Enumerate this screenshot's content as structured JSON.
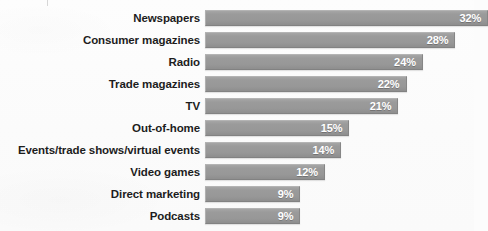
{
  "chart_data": {
    "type": "bar",
    "orientation": "horizontal",
    "title": "",
    "subtitle": "",
    "xlabel": "",
    "ylabel": "",
    "grid": false,
    "legend": null,
    "value_suffix": "%",
    "xlim": [
      0,
      32
    ],
    "categories": [
      "Newspapers",
      "Consumer magazines",
      "Radio",
      "Trade magazines",
      "TV",
      "Out-of-home",
      "Events/trade shows/virtual events",
      "Video games",
      "Direct marketing",
      "Podcasts"
    ],
    "values": [
      32,
      28,
      24,
      22,
      21,
      15,
      14,
      12,
      9,
      9
    ],
    "value_labels": [
      "32%",
      "28%",
      "24%",
      "22%",
      "21%",
      "15%",
      "14%",
      "12%",
      "9%",
      "9%"
    ],
    "bars": [
      {
        "label": "Newspapers",
        "value": 32,
        "value_label": "32%"
      },
      {
        "label": "Consumer magazines",
        "value": 28,
        "value_label": "28%"
      },
      {
        "label": "Radio",
        "value": 24,
        "value_label": "24%"
      },
      {
        "label": "Trade magazines",
        "value": 22,
        "value_label": "22%"
      },
      {
        "label": "TV",
        "value": 21,
        "value_label": "21%"
      },
      {
        "label": "Out-of-home",
        "value": 15,
        "value_label": "15%"
      },
      {
        "label": "Events/trade shows/virtual events",
        "value": 14,
        "value_label": "14%"
      },
      {
        "label": "Video games",
        "value": 12,
        "value_label": "12%"
      },
      {
        "label": "Direct marketing",
        "value": 9,
        "value_label": "9%"
      },
      {
        "label": "Podcasts",
        "value": 9,
        "value_label": "9%"
      }
    ],
    "colors": {
      "bar_fill": "#9a9a9a",
      "bar_border": "#868686",
      "label_text": "#1d1d1d",
      "value_text": "#ffffff",
      "background": "#fcfcfc"
    }
  }
}
